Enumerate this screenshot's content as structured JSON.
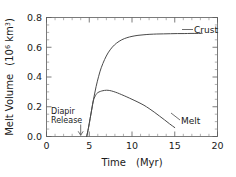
{
  "chart_data": {
    "type": "line",
    "title": "",
    "xlabel": "Time",
    "xlabel_units": "(Myr)",
    "ylabel": "Melt Volume",
    "ylabel_units_base": "(10",
    "ylabel_units_exp": "6",
    "ylabel_units_tail": " km",
    "ylabel_units_exp2": "3",
    "ylabel_units_close": ")",
    "ylabel_full": "Melt Volume (10^6 km^3)",
    "xlim": [
      0,
      20
    ],
    "ylim": [
      0.0,
      0.8
    ],
    "xticks": [
      0,
      5,
      10,
      15,
      20
    ],
    "xtick_labels": [
      "0",
      "5",
      "10",
      "15",
      "20"
    ],
    "yticks": [
      0.0,
      0.2,
      0.4,
      0.6,
      0.8
    ],
    "ytick_labels": [
      "0.0",
      "0.2",
      "0.4",
      "0.6",
      "0.8"
    ],
    "x_minor_interval": 1,
    "y_minor_interval": 0.05,
    "grid": false,
    "legend_position": "inline-labels",
    "series": [
      {
        "name": "Crust",
        "label": "Crust",
        "x": [
          4.7,
          4.9,
          5.1,
          5.3,
          5.5,
          5.8,
          6.1,
          6.4,
          6.8,
          7.2,
          7.7,
          8.2,
          8.8,
          9.4,
          10.0,
          10.7,
          11.4,
          12.1,
          12.9,
          13.7,
          14.5,
          15.3,
          16.1,
          16.9,
          17.6,
          18.2
        ],
        "y": [
          0.0,
          0.055,
          0.12,
          0.185,
          0.25,
          0.335,
          0.405,
          0.462,
          0.518,
          0.562,
          0.601,
          0.628,
          0.65,
          0.664,
          0.673,
          0.68,
          0.684,
          0.687,
          0.689,
          0.69,
          0.691,
          0.692,
          0.692,
          0.693,
          0.693,
          0.693
        ]
      },
      {
        "name": "Melt",
        "label": "Melt",
        "x": [
          4.7,
          4.9,
          5.1,
          5.3,
          5.5,
          5.8,
          6.0,
          6.3,
          6.6,
          7.0,
          7.4,
          7.8,
          8.3,
          8.8,
          9.4,
          10.0,
          10.7,
          11.4,
          12.0,
          12.6,
          13.2,
          13.8,
          14.4,
          15.0
        ],
        "y": [
          0.0,
          0.055,
          0.12,
          0.185,
          0.245,
          0.282,
          0.295,
          0.303,
          0.308,
          0.311,
          0.309,
          0.303,
          0.293,
          0.281,
          0.266,
          0.25,
          0.231,
          0.21,
          0.188,
          0.164,
          0.138,
          0.112,
          0.085,
          0.06
        ]
      }
    ],
    "annotations": [
      {
        "name": "diapir-release",
        "line1": "Diapir",
        "line2": "Release",
        "x": 4.0,
        "y_text": 0.1,
        "arrow_to_y": 0.0,
        "arrow": "down"
      }
    ]
  }
}
